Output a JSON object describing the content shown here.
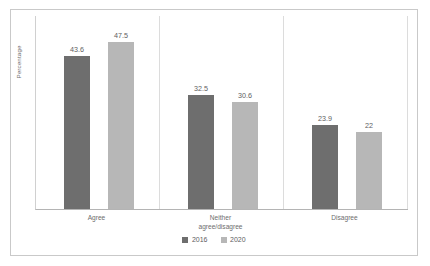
{
  "chart_data": {
    "type": "bar",
    "title": "",
    "xlabel": "",
    "ylabel": "Percentage",
    "ylim": [
      0,
      55
    ],
    "grid": false,
    "legend_position": "bottom",
    "categories": [
      "Agree",
      "Neither agree/disagree",
      "Disagree"
    ],
    "category_lines": [
      [
        "Agree"
      ],
      [
        "Neither",
        "agree/disagree"
      ],
      [
        "Disagree"
      ]
    ],
    "series": [
      {
        "name": "2016",
        "color": "#6e6e6e",
        "values": [
          43.6,
          32.5,
          23.9
        ],
        "labels": [
          "43.6",
          "32.5",
          "23.9"
        ]
      },
      {
        "name": "2020",
        "color": "#b7b7b7",
        "values": [
          47.5,
          30.6,
          22
        ],
        "labels": [
          "47.5",
          "30.6",
          "22"
        ]
      }
    ]
  },
  "axis": {
    "y_title": "Percentage"
  },
  "legend": {
    "items": [
      {
        "label": "2016",
        "color": "#6e6e6e"
      },
      {
        "label": "2020",
        "color": "#b7b7b7"
      }
    ]
  }
}
